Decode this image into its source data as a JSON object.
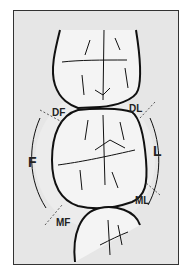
{
  "diagram": {
    "labels": {
      "df": "DF",
      "dl": "DL",
      "f": "F",
      "l": "L",
      "mf": "MF",
      "ml": "ML"
    },
    "colors": {
      "background": "#e6e6e6",
      "tooth_fill": "#f4f4f4",
      "outline": "#111111",
      "frame_border": "#333333"
    }
  }
}
